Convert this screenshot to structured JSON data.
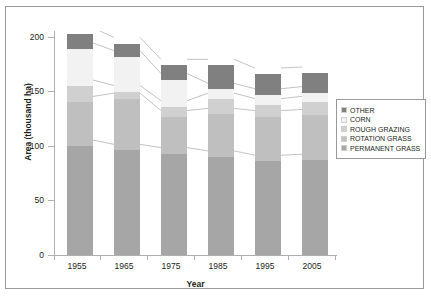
{
  "chart_data": {
    "type": "bar",
    "subtype": "stacked-bar",
    "title": "",
    "xlabel": "Year",
    "ylabel": "Area (thousand ha)",
    "categories": [
      "1955",
      "1965",
      "1975",
      "1985",
      "1995",
      "2005"
    ],
    "ylim": [
      0,
      200
    ],
    "y_ticks": [
      "0",
      "50",
      "100",
      "150",
      "200"
    ],
    "y_tick_values": [
      0,
      50,
      100,
      150,
      200
    ],
    "grid": false,
    "legend_position": "right",
    "stack_order_bottom_to_top": [
      "PERMANENT GRASS",
      "ROTATION GRASS",
      "ROUGH GRAZING",
      "CORN",
      "OTHER"
    ],
    "series": [
      {
        "name": "PERMANENT GRASS",
        "color": "#a6a6a6",
        "values": [
          100,
          96,
          93,
          90,
          86,
          87
        ]
      },
      {
        "name": "ROTATION GRASS",
        "color": "#bfbfbf",
        "values": [
          40,
          47,
          34,
          39,
          41,
          41
        ]
      },
      {
        "name": "ROUGH GRAZING",
        "color": "#d0d0d0",
        "values": [
          15,
          7,
          9,
          14,
          11,
          12
        ]
      },
      {
        "name": "CORN",
        "color": "#f2f2f2",
        "values": [
          34,
          32,
          25,
          9,
          9,
          9
        ]
      },
      {
        "name": "OTHER",
        "color": "#808080",
        "values": [
          14,
          12,
          13,
          22,
          19,
          18
        ]
      }
    ],
    "totals": [
      203,
      194,
      174,
      174,
      166,
      167
    ]
  },
  "legend": {
    "items": [
      {
        "label": "OTHER",
        "color": "#808080"
      },
      {
        "label": "CORN",
        "color": "#f2f2f2"
      },
      {
        "label": "ROUGH GRAZING",
        "color": "#d0d0d0"
      },
      {
        "label": "ROTATION GRASS",
        "color": "#bfbfbf"
      },
      {
        "label": "PERMANENT GRASS",
        "color": "#a6a6a6"
      }
    ]
  },
  "axes": {
    "y_title": "Area (thousand ha)",
    "x_title": "Year",
    "y_tick_labels": [
      "200",
      "150",
      "100",
      "50",
      "0"
    ],
    "x_tick_labels": [
      "1955",
      "1965",
      "1975",
      "1985",
      "1995",
      "2005"
    ]
  },
  "colors": {
    "frame": "#9a9a9a",
    "axis": "#b0b0b0",
    "text": "#231f20",
    "connector": "#9a9a9a"
  }
}
